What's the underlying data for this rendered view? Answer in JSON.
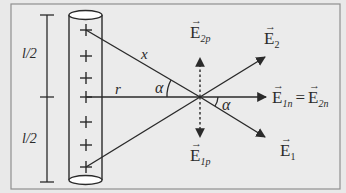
{
  "diagram": {
    "colors": {
      "background": "#e9e9e9",
      "stroke": "#2a2a2a",
      "frame": "#8a8a8a",
      "cylinder_cap": "#ffffff"
    },
    "dimension_labels": {
      "upper_half": "l/2",
      "lower_half": "l/2"
    },
    "charges": {
      "symbol": "+",
      "count": 7
    },
    "distance_labels": {
      "slant": "x",
      "perpendicular": "r"
    },
    "angle_labels": {
      "left": "α",
      "right": "α"
    },
    "vectors": {
      "E2": {
        "base": "E",
        "sub": "2"
      },
      "E1": {
        "base": "E",
        "sub": "1"
      },
      "E2p": {
        "base": "E",
        "sub": "2p"
      },
      "E1p": {
        "base": "E",
        "sub": "1p"
      }
    },
    "equation": {
      "lhs": {
        "base": "E",
        "sub": "1n"
      },
      "operator": "=",
      "rhs": {
        "base": "E",
        "sub": "2n"
      }
    }
  }
}
